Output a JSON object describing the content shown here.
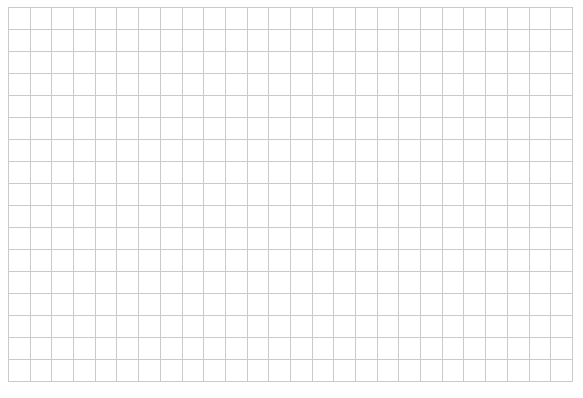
{
  "grid": {
    "rows": 17,
    "columns": 26,
    "line_color": "#cacaca",
    "background": "#ffffff",
    "cells_text": ""
  }
}
